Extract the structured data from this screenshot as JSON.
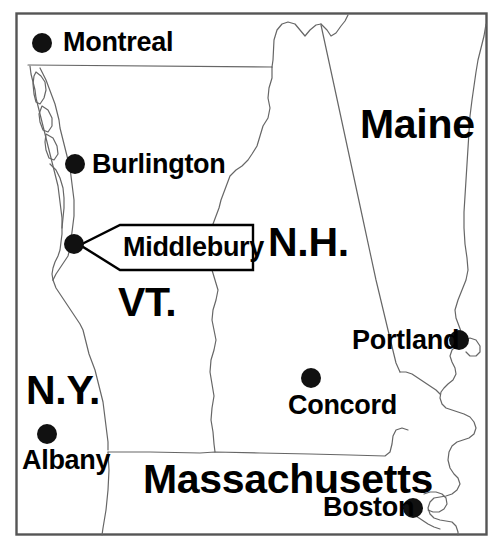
{
  "map": {
    "title": "New England and Adjacent Region Locator Map",
    "style": {
      "ink_color": "#000000",
      "background_color": "#ffffff",
      "frame_color": "#555555",
      "border_line_color": "#666666",
      "coastline_color": "#666666"
    },
    "frame": {
      "x": 16,
      "y": 13,
      "width": 471,
      "height": 522
    },
    "state_labels": [
      {
        "id": "maine",
        "text": "Maine",
        "x": 360,
        "y": 104,
        "size": "large"
      },
      {
        "id": "new-hampshire",
        "text": "N.H.",
        "x": 268,
        "y": 222,
        "size": "large"
      },
      {
        "id": "vermont",
        "text": "VT.",
        "x": 118,
        "y": 282,
        "size": "large"
      },
      {
        "id": "new-york",
        "text": "N.Y.",
        "x": 26,
        "y": 370,
        "size": "large"
      },
      {
        "id": "massachusetts",
        "text": "Massachusetts",
        "x": 143,
        "y": 459,
        "size": "large"
      }
    ],
    "cities": [
      {
        "id": "montreal",
        "name": "Montreal",
        "dot_x": 42,
        "dot_y": 43,
        "label_x": 63,
        "label_y": 29,
        "label_side": "right"
      },
      {
        "id": "burlington",
        "name": "Burlington",
        "dot_x": 75,
        "dot_y": 164,
        "label_x": 92,
        "label_y": 151,
        "label_side": "right"
      },
      {
        "id": "middlebury",
        "name": "Middlebury",
        "dot_x": 74,
        "dot_y": 244,
        "label_x": 123,
        "label_y": 234,
        "label_side": "callout"
      },
      {
        "id": "portland",
        "name": "Portland",
        "dot_x": 459,
        "dot_y": 340,
        "label_x": 352,
        "label_y": 327,
        "label_side": "left"
      },
      {
        "id": "concord",
        "name": "Concord",
        "dot_x": 311,
        "dot_y": 378,
        "label_x": 288,
        "label_y": 392,
        "label_side": "below"
      },
      {
        "id": "albany",
        "name": "Albany",
        "dot_x": 47,
        "dot_y": 434,
        "label_x": 22,
        "label_y": 447,
        "label_side": "below"
      },
      {
        "id": "boston",
        "name": "Boston",
        "dot_x": 413,
        "dot_y": 508,
        "label_x": 323,
        "label_y": 494,
        "label_side": "left"
      }
    ],
    "callout": {
      "id": "middlebury-callout",
      "text": "Middlebury",
      "tip_x": 80,
      "tip_y": 245,
      "box_left": 120,
      "box_right": 253,
      "box_top": 224,
      "box_bottom": 270
    },
    "icons": {
      "city_dot": "filled-circle-marker"
    }
  }
}
